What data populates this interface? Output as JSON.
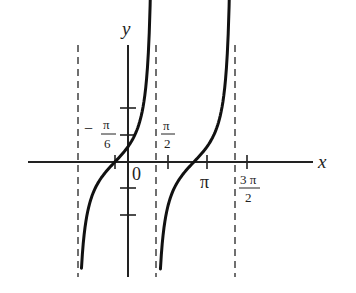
{
  "chart_data": {
    "type": "line",
    "title": "",
    "function": "y = tan(x + π/6)",
    "xlabel": "x",
    "ylabel": "y",
    "origin_label": "0",
    "x_tick_labels": [
      {
        "label_num": "π",
        "label_den": "6",
        "sign": "−",
        "value": -0.5236
      },
      {
        "label_num": "π",
        "label_den": "2",
        "sign": "",
        "value": 1.5708
      },
      {
        "label": "π",
        "value": 3.1416
      },
      {
        "label_num": "3 π",
        "label_den": "2",
        "sign": "",
        "value": 4.7124
      }
    ],
    "y_ticks": [
      -2,
      -1,
      1,
      2
    ],
    "asymptotes_x": [
      -2.0944,
      1.0472,
      4.1888
    ],
    "zeros_x": [
      -0.5236,
      2.618
    ],
    "series": [
      {
        "name": "branch-1",
        "x_range": [
          -1.85,
          0.95
        ]
      },
      {
        "name": "branch-2",
        "x_range": [
          1.29,
          4.09
        ]
      }
    ],
    "grid": false,
    "legend": null,
    "colors": {
      "curve": "#111111",
      "axis": "#222222",
      "asymptote": "#333333"
    }
  }
}
